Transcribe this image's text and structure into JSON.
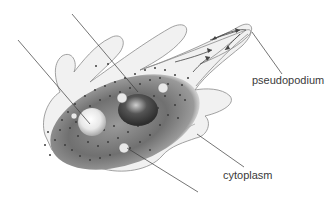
{
  "diagram": {
    "labels": [
      {
        "id": "pseudopodium",
        "text": "pseudopodium"
      },
      {
        "id": "cytoplasm",
        "text": "cytoplasm"
      }
    ],
    "unlabeled_leader_lines": 3,
    "colors": {
      "outline": "#8a8a8a",
      "body_fill": "#f1f1f1",
      "endoplasm": "#6e6e6e",
      "granules": "#3c3c3c",
      "leader_line": "#3a3a3a",
      "label_text": "#3a3a3a"
    }
  }
}
